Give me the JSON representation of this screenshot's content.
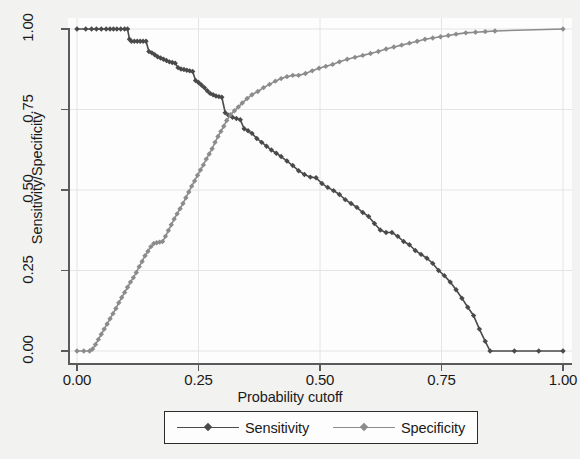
{
  "chart_data": {
    "type": "line",
    "title": "",
    "xlabel": "Probability cutoff",
    "ylabel": "Sensitivity/Specificity",
    "xlim": [
      0.0,
      1.0
    ],
    "ylim": [
      0.0,
      1.0
    ],
    "xticks": [
      "0.00",
      "0.25",
      "0.50",
      "0.75",
      "1.00"
    ],
    "xtick_values": [
      0.0,
      0.25,
      0.5,
      0.75,
      1.0
    ],
    "yticks": [
      "0.00",
      "0.25",
      "0.50",
      "0.75",
      "1.00"
    ],
    "ytick_values": [
      0.0,
      0.25,
      0.5,
      0.75,
      1.0
    ],
    "grid": true,
    "legend_position": "below-center",
    "colors": {
      "sensitivity": "#4a4a4a",
      "specificity": "#8c8c8c",
      "axis": "#5a5a5a",
      "grid": "#e4e4e4",
      "figure_background": "#f2f2f0",
      "plot_background": "#fdfdfd",
      "text": "#1a1a1a"
    },
    "series": [
      {
        "name": "Sensitivity",
        "color": "#4a4a4a",
        "marker": "diamond",
        "x": [
          0.0,
          0.018,
          0.03,
          0.04,
          0.05,
          0.06,
          0.068,
          0.075,
          0.082,
          0.09,
          0.098,
          0.104,
          0.108,
          0.112,
          0.118,
          0.124,
          0.13,
          0.136,
          0.142,
          0.148,
          0.154,
          0.16,
          0.166,
          0.172,
          0.178,
          0.184,
          0.19,
          0.196,
          0.202,
          0.208,
          0.214,
          0.22,
          0.226,
          0.232,
          0.238,
          0.244,
          0.25,
          0.256,
          0.262,
          0.268,
          0.274,
          0.28,
          0.286,
          0.292,
          0.298,
          0.305,
          0.312,
          0.32,
          0.328,
          0.336,
          0.344,
          0.352,
          0.36,
          0.37,
          0.38,
          0.39,
          0.4,
          0.41,
          0.42,
          0.432,
          0.444,
          0.456,
          0.468,
          0.48,
          0.492,
          0.504,
          0.516,
          0.528,
          0.54,
          0.552,
          0.564,
          0.576,
          0.588,
          0.6,
          0.612,
          0.624,
          0.636,
          0.648,
          0.66,
          0.672,
          0.684,
          0.696,
          0.708,
          0.72,
          0.732,
          0.744,
          0.756,
          0.768,
          0.78,
          0.792,
          0.804,
          0.816,
          0.828,
          0.84,
          0.85,
          0.9,
          0.95,
          1.0
        ],
        "y": [
          1.0,
          1.0,
          1.0,
          1.0,
          1.0,
          1.0,
          1.0,
          1.0,
          1.0,
          1.0,
          1.0,
          1.0,
          0.968,
          0.962,
          0.962,
          0.962,
          0.962,
          0.962,
          0.962,
          0.93,
          0.926,
          0.92,
          0.914,
          0.91,
          0.906,
          0.902,
          0.898,
          0.896,
          0.894,
          0.88,
          0.876,
          0.874,
          0.872,
          0.87,
          0.868,
          0.84,
          0.834,
          0.826,
          0.818,
          0.808,
          0.8,
          0.796,
          0.792,
          0.79,
          0.788,
          0.74,
          0.732,
          0.726,
          0.722,
          0.718,
          0.69,
          0.684,
          0.676,
          0.66,
          0.648,
          0.636,
          0.624,
          0.614,
          0.604,
          0.59,
          0.576,
          0.56,
          0.548,
          0.54,
          0.538,
          0.52,
          0.508,
          0.498,
          0.486,
          0.47,
          0.458,
          0.446,
          0.43,
          0.418,
          0.396,
          0.376,
          0.368,
          0.368,
          0.356,
          0.34,
          0.33,
          0.312,
          0.3,
          0.288,
          0.272,
          0.25,
          0.234,
          0.214,
          0.19,
          0.164,
          0.136,
          0.11,
          0.068,
          0.03,
          0.0,
          0.0,
          0.0,
          0.0
        ]
      },
      {
        "name": "Specificity",
        "color": "#8c8c8c",
        "marker": "diamond",
        "x": [
          0.0,
          0.014,
          0.026,
          0.032,
          0.038,
          0.044,
          0.05,
          0.056,
          0.062,
          0.068,
          0.074,
          0.08,
          0.086,
          0.092,
          0.098,
          0.104,
          0.11,
          0.116,
          0.122,
          0.128,
          0.134,
          0.14,
          0.146,
          0.152,
          0.158,
          0.164,
          0.17,
          0.176,
          0.182,
          0.188,
          0.194,
          0.2,
          0.206,
          0.212,
          0.218,
          0.224,
          0.23,
          0.236,
          0.242,
          0.248,
          0.254,
          0.26,
          0.266,
          0.272,
          0.278,
          0.284,
          0.29,
          0.296,
          0.302,
          0.308,
          0.316,
          0.324,
          0.332,
          0.34,
          0.35,
          0.36,
          0.372,
          0.384,
          0.396,
          0.408,
          0.42,
          0.432,
          0.444,
          0.456,
          0.47,
          0.484,
          0.498,
          0.512,
          0.526,
          0.54,
          0.556,
          0.572,
          0.588,
          0.604,
          0.62,
          0.636,
          0.652,
          0.668,
          0.684,
          0.7,
          0.716,
          0.732,
          0.748,
          0.764,
          0.78,
          0.8,
          0.82,
          0.84,
          0.86,
          1.0
        ],
        "y": [
          0.0,
          0.0,
          0.0,
          0.006,
          0.02,
          0.036,
          0.052,
          0.068,
          0.084,
          0.1,
          0.116,
          0.132,
          0.15,
          0.166,
          0.182,
          0.198,
          0.214,
          0.228,
          0.244,
          0.262,
          0.278,
          0.296,
          0.31,
          0.324,
          0.334,
          0.336,
          0.338,
          0.34,
          0.356,
          0.374,
          0.392,
          0.41,
          0.426,
          0.442,
          0.458,
          0.476,
          0.494,
          0.512,
          0.528,
          0.546,
          0.562,
          0.578,
          0.596,
          0.612,
          0.628,
          0.648,
          0.666,
          0.682,
          0.698,
          0.716,
          0.734,
          0.746,
          0.758,
          0.77,
          0.784,
          0.796,
          0.806,
          0.818,
          0.828,
          0.838,
          0.846,
          0.852,
          0.856,
          0.856,
          0.862,
          0.87,
          0.878,
          0.884,
          0.89,
          0.898,
          0.906,
          0.912,
          0.918,
          0.924,
          0.93,
          0.938,
          0.944,
          0.95,
          0.956,
          0.962,
          0.968,
          0.972,
          0.976,
          0.98,
          0.984,
          0.988,
          0.99,
          0.992,
          0.994,
          1.0
        ]
      }
    ]
  },
  "axes": {
    "y_title": "Sensitivity/Specificity",
    "x_title": "Probability cutoff",
    "y_tick_labels": [
      "1.00",
      "0.75",
      "0.50",
      "0.25",
      "0.00"
    ],
    "x_tick_labels": [
      "0.00",
      "0.25",
      "0.50",
      "0.75",
      "1.00"
    ]
  },
  "legend": {
    "entries": [
      {
        "label": "Sensitivity",
        "color": "#4a4a4a"
      },
      {
        "label": "Specificity",
        "color": "#8c8c8c"
      }
    ]
  }
}
